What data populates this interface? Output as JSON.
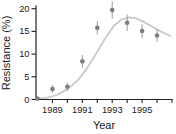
{
  "figure": {
    "background": "#ffffff"
  },
  "chart_data": {
    "type": "scatter",
    "title": "",
    "xlabel": "Year",
    "ylabel": "Resistance (%)",
    "xlim": [
      1987.9,
      1997.0
    ],
    "ylim": [
      0,
      20.6
    ],
    "grid": false,
    "legend": null,
    "y_ticks": [
      0,
      5,
      10,
      15,
      20
    ],
    "x_ticks": [
      1989,
      1990,
      1991,
      1992,
      1993,
      1994,
      1995,
      1996,
      1997
    ],
    "x_labeled_ticks": [
      1989,
      1991,
      1993,
      1995
    ],
    "series": [
      {
        "name": "Observed resistance",
        "type": "scatter-errorbar",
        "x": [
          1988,
          1989,
          1990,
          1991,
          1992,
          1993,
          1994,
          1995,
          1996
        ],
        "y": [
          0.2,
          2.3,
          2.8,
          8.4,
          15.8,
          19.7,
          16.9,
          15.1,
          14.1
        ],
        "yerr": [
          0.2,
          0.9,
          0.9,
          1.4,
          1.5,
          1.9,
          1.8,
          1.5,
          1.4
        ]
      },
      {
        "name": "Fitted trend curve",
        "type": "line-smooth",
        "points": [
          [
            1987.95,
            0.1
          ],
          [
            1988.6,
            0.35
          ],
          [
            1989.3,
            1.0
          ],
          [
            1990.0,
            2.3
          ],
          [
            1990.7,
            4.2
          ],
          [
            1991.3,
            6.8
          ],
          [
            1991.9,
            10.0
          ],
          [
            1992.5,
            13.3
          ],
          [
            1993.1,
            16.2
          ],
          [
            1993.6,
            17.6
          ],
          [
            1994.1,
            18.1
          ],
          [
            1994.6,
            17.9
          ],
          [
            1995.1,
            17.1
          ],
          [
            1995.7,
            16.0
          ],
          [
            1996.3,
            14.9
          ],
          [
            1996.9,
            14.0
          ]
        ]
      }
    ],
    "colors": {
      "axis": "#222222",
      "text": "#1a1a1a",
      "marker": "#7d7d7d",
      "error_bar": "#a6a6a6",
      "curve": "#c9c9c9",
      "background": "#ffffff"
    }
  }
}
